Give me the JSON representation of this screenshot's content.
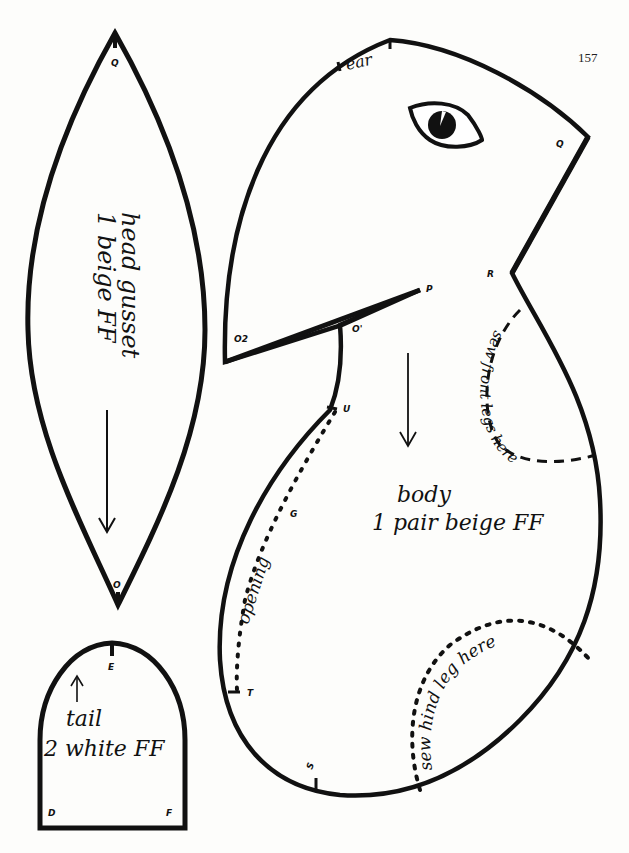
{
  "page": {
    "number": "157"
  },
  "pieces": {
    "head_gusset": {
      "title": "head gusset",
      "instruction": "1 beige FF",
      "points": {
        "top": "Q",
        "bottom": "O"
      }
    },
    "tail": {
      "title": "tail",
      "instruction": "2 white FF",
      "points": {
        "top": "E",
        "left": "D",
        "right": "F"
      }
    },
    "body": {
      "title": "body",
      "instruction": "1 pair beige FF",
      "marks": {
        "ear": "ear",
        "q": "Q",
        "r": "R",
        "p": "P",
        "o1": "O'",
        "o2": "O2",
        "u": "U",
        "g": "G",
        "t": "T",
        "s": "S"
      },
      "notes": {
        "opening": "opening",
        "front_legs": "sew front legs here",
        "hind_leg": "sew hind leg here"
      }
    }
  },
  "colors": {
    "ink": "#111111",
    "paper": "#fdfdfb"
  }
}
